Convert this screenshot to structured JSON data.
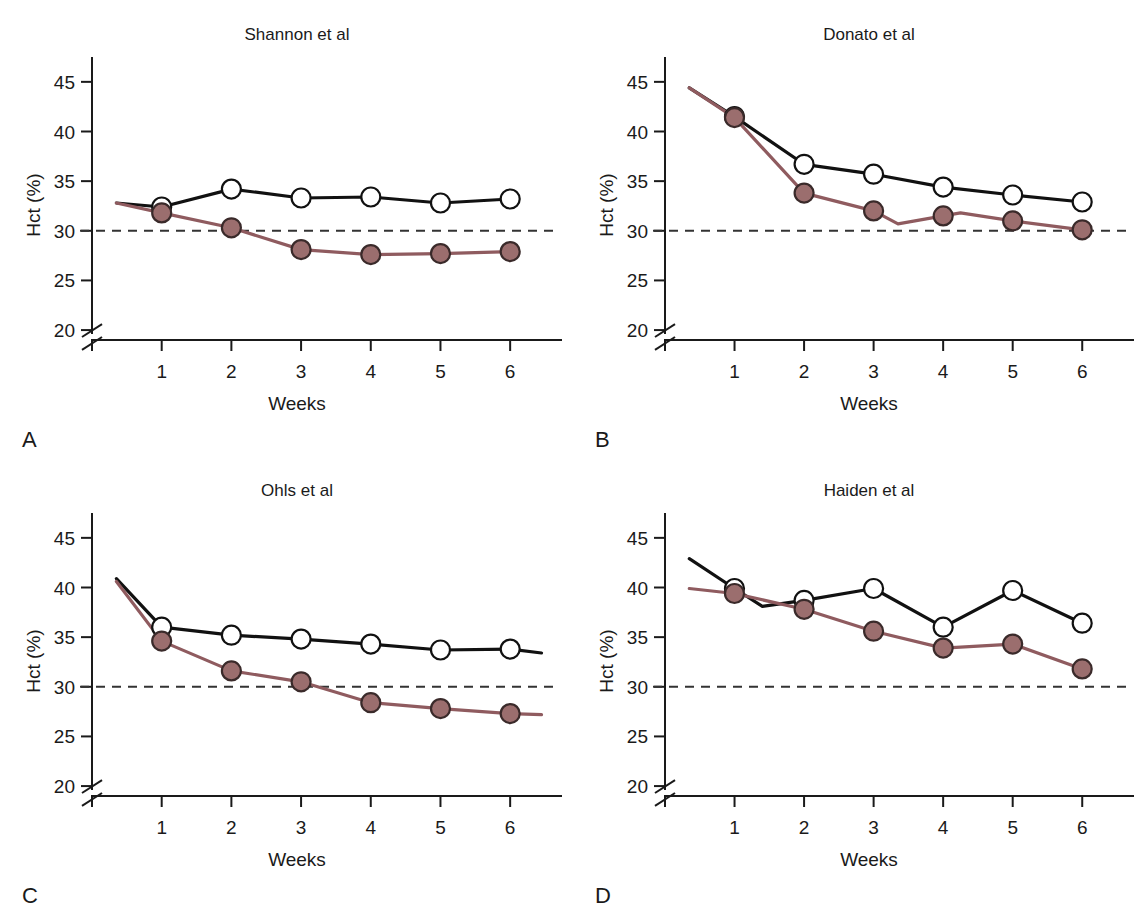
{
  "figure": {
    "axis_labels": {
      "y": "Hct (%)",
      "x": "Weeks"
    },
    "y_ticks": [
      "20",
      "25",
      "30",
      "35",
      "40",
      "45"
    ],
    "x_ticks": [
      "1",
      "2",
      "3",
      "4",
      "5",
      "6"
    ],
    "colors": {
      "control_line": "#111111",
      "treatment_line": "#8f5b5f",
      "marker_open_fill": "#ffffff",
      "marker_filled_fill": "#9b6e6e",
      "reference_line": "#333333",
      "axis": "#1a1a1a"
    },
    "reference_value": 30,
    "axis_break": true
  },
  "panels": [
    {
      "letter": "A",
      "title": "Shannon et al"
    },
    {
      "letter": "B",
      "title": "Donato et al"
    },
    {
      "letter": "C",
      "title": "Ohls et al"
    },
    {
      "letter": "D",
      "title": "Haiden et al"
    }
  ],
  "chart_data": [
    {
      "type": "line",
      "panel": "A",
      "title": "Shannon et al",
      "xlabel": "Weeks",
      "ylabel": "Hct (%)",
      "xlim": [
        0,
        6.5
      ],
      "ylim": [
        19,
        47
      ],
      "yticks": [
        20,
        25,
        30,
        35,
        40,
        45
      ],
      "xticks": [
        1,
        2,
        3,
        4,
        5,
        6
      ],
      "grid": false,
      "legend": "none",
      "axis_break_y": true,
      "reference_line": {
        "value": 30,
        "style": "dashed"
      },
      "lead_in": {
        "x": 0.35,
        "control": 32.8,
        "treatment": 32.8
      },
      "categories": [
        1,
        2,
        3,
        4,
        5,
        6
      ],
      "series": [
        {
          "name": "control",
          "marker": "open-circle",
          "values": [
            32.4,
            34.2,
            33.3,
            33.4,
            32.8,
            33.2
          ]
        },
        {
          "name": "treatment",
          "marker": "filled-circle",
          "values": [
            31.8,
            30.3,
            28.1,
            27.6,
            27.7,
            27.9
          ]
        }
      ]
    },
    {
      "type": "line",
      "panel": "B",
      "title": "Donato et al",
      "xlabel": "Weeks",
      "ylabel": "Hct (%)",
      "xlim": [
        0,
        6.5
      ],
      "ylim": [
        19,
        47
      ],
      "yticks": [
        20,
        25,
        30,
        35,
        40,
        45
      ],
      "xticks": [
        1,
        2,
        3,
        4,
        5,
        6
      ],
      "grid": false,
      "legend": "none",
      "axis_break_y": true,
      "reference_line": {
        "value": 30,
        "style": "dashed"
      },
      "lead_in": {
        "x": 0.35,
        "control": 44.4,
        "treatment": 44.4
      },
      "categories": [
        1,
        2,
        3,
        4,
        5,
        6
      ],
      "series": [
        {
          "name": "control",
          "marker": "open-circle",
          "values": [
            41.5,
            36.7,
            35.7,
            34.4,
            33.6,
            32.9
          ]
        },
        {
          "name": "treatment",
          "marker": "filled-circle",
          "values": [
            41.4,
            33.8,
            32.0,
            31.5,
            31.0,
            30.1
          ],
          "interpolated_dip": {
            "between": [
              3,
              4
            ],
            "x": 3.35,
            "value": 30.7
          },
          "interpolated_bump": {
            "between": [
              4,
              5
            ],
            "x": 4.25,
            "value": 31.8
          }
        }
      ]
    },
    {
      "type": "line",
      "panel": "C",
      "title": "Ohls et al",
      "xlabel": "Weeks",
      "ylabel": "Hct (%)",
      "xlim": [
        0,
        6.5
      ],
      "ylim": [
        19,
        47
      ],
      "yticks": [
        20,
        25,
        30,
        35,
        40,
        45
      ],
      "xticks": [
        1,
        2,
        3,
        4,
        5,
        6
      ],
      "grid": false,
      "legend": "none",
      "axis_break_y": true,
      "reference_line": {
        "value": 30,
        "style": "dashed"
      },
      "lead_in": {
        "x": 0.35,
        "control": 40.9,
        "treatment": 40.6
      },
      "tail": {
        "x": 6.45,
        "control": 33.4,
        "treatment": 27.2
      },
      "categories": [
        1,
        2,
        3,
        4,
        5,
        6
      ],
      "series": [
        {
          "name": "control",
          "marker": "open-circle",
          "values": [
            36.0,
            35.2,
            34.8,
            34.3,
            33.7,
            33.8
          ]
        },
        {
          "name": "treatment",
          "marker": "filled-circle",
          "values": [
            34.6,
            31.6,
            30.5,
            28.4,
            27.8,
            27.3
          ]
        }
      ]
    },
    {
      "type": "line",
      "panel": "D",
      "title": "Haiden et al",
      "xlabel": "Weeks",
      "ylabel": "Hct (%)",
      "xlim": [
        0,
        6.5
      ],
      "ylim": [
        19,
        47
      ],
      "yticks": [
        20,
        25,
        30,
        35,
        40,
        45
      ],
      "xticks": [
        1,
        2,
        3,
        4,
        5,
        6
      ],
      "grid": false,
      "legend": "none",
      "axis_break_y": true,
      "reference_line": {
        "value": 30,
        "style": "dashed"
      },
      "lead_in": {
        "x": 0.35,
        "control": 42.9,
        "treatment": 39.9
      },
      "categories": [
        1,
        2,
        3,
        4,
        5,
        6
      ],
      "series": [
        {
          "name": "control",
          "marker": "open-circle",
          "values": [
            39.9,
            38.7,
            39.9,
            36.0,
            39.7,
            36.4
          ],
          "interpolated_dip": {
            "between": [
              1,
              2
            ],
            "x": 1.4,
            "value": 38.1
          }
        },
        {
          "name": "treatment",
          "marker": "filled-circle",
          "values": [
            39.4,
            37.8,
            35.6,
            33.9,
            34.3,
            31.8
          ]
        }
      ]
    }
  ]
}
